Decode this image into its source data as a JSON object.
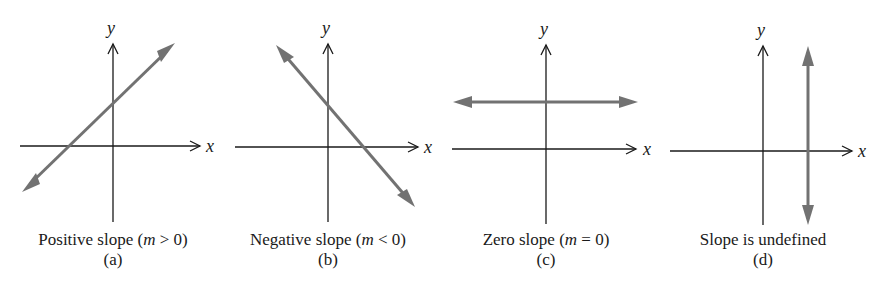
{
  "figure": {
    "panels": [
      {
        "id": "a",
        "caption_pre": "Positive slope (",
        "caption_var": "m",
        "caption_post": " > 0)",
        "letter": "(a)",
        "x_label": "x",
        "y_label": "y",
        "line_type": "positive-slope"
      },
      {
        "id": "b",
        "caption_pre": "Negative slope (",
        "caption_var": "m",
        "caption_post": " < 0)",
        "letter": "(b)",
        "x_label": "x",
        "y_label": "y",
        "line_type": "negative-slope"
      },
      {
        "id": "c",
        "caption_pre": "Zero slope (",
        "caption_var": "m",
        "caption_post": " = 0)",
        "letter": "(c)",
        "x_label": "x",
        "y_label": "y",
        "line_type": "horizontal"
      },
      {
        "id": "d",
        "caption_pre": "Slope is undefined",
        "caption_var": "",
        "caption_post": "",
        "letter": "(d)",
        "x_label": "x",
        "y_label": "y",
        "line_type": "vertical"
      }
    ],
    "colors": {
      "axis": "#1a1a1a",
      "line": "#727272",
      "background": "#ffffff"
    }
  }
}
